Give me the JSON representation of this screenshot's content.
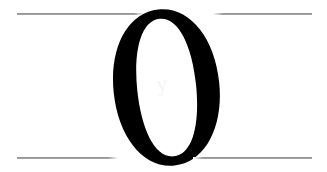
{
  "document": {
    "kind": "scanned-page-fragment",
    "background_color": "#ffffff",
    "width_px": 327,
    "height_px": 172
  },
  "rules": {
    "color": "#6e6e71",
    "top": {
      "left_segment_label": "",
      "right_segment_label": ""
    },
    "bottom": {
      "left_segment_label": "",
      "right_segment_label": ""
    }
  },
  "glyph": {
    "character": "O",
    "name": "capital-letter-o",
    "color": "#000000",
    "style": "didone-serif-italic",
    "caption": "O"
  },
  "ghost_mark": {
    "name": "show-through-ghost",
    "text": "y"
  }
}
